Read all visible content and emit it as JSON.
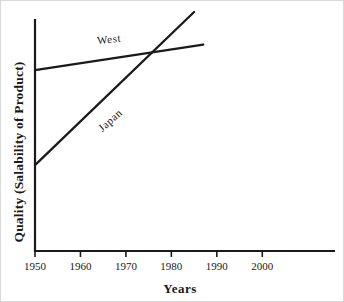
{
  "chart_data": {
    "type": "line",
    "title": "",
    "xlabel": "Years",
    "ylabel": "Quality (Salability of Product)",
    "x_ticks": [
      1950,
      1960,
      1970,
      1980,
      1990,
      2000
    ],
    "x_range": [
      1950,
      2016
    ],
    "y_range": [
      0,
      100
    ],
    "y_ticks": [],
    "grid": false,
    "legend_position": "inline-labels",
    "line_color": "#1a1a1a",
    "background_color": "#ffffff",
    "series": [
      {
        "name": "West",
        "x": [
          1950,
          1987
        ],
        "y": [
          78,
          89
        ]
      },
      {
        "name": "Japan",
        "x": [
          1950,
          1985
        ],
        "y": [
          37,
          103
        ]
      }
    ],
    "annotations": [
      {
        "text": "West",
        "near_year": 1966,
        "near_quality": 91,
        "angle_deg": -6
      },
      {
        "text": "Japan",
        "near_year": 1966,
        "near_quality": 56,
        "angle_deg": -42
      }
    ],
    "crossing_point": {
      "year": 1976,
      "quality": 86
    }
  }
}
